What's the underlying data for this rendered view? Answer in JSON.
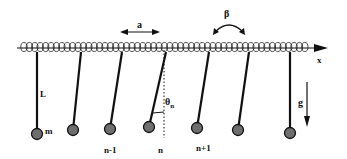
{
  "diagram": {
    "labels": {
      "spacing": "a",
      "torsion": "β",
      "axis": "x",
      "length": "L",
      "mass": "m",
      "angle": "θ",
      "angle_sub": "n",
      "gravity": "g",
      "index_prev": "n-1",
      "index_curr": "n",
      "index_next": "n+1"
    },
    "colors": {
      "line": "#111111",
      "bob_fill": "#6e6e6e",
      "background": "#ffffff"
    },
    "pendulums": [
      {
        "top_x": 37,
        "bob_x": 37,
        "bob_y": 134
      },
      {
        "top_x": 81,
        "bob_x": 73,
        "bob_y": 130
      },
      {
        "top_x": 122,
        "bob_x": 110,
        "bob_y": 129
      },
      {
        "top_x": 166,
        "bob_x": 149,
        "bob_y": 127
      },
      {
        "top_x": 209,
        "bob_x": 197,
        "bob_y": 128
      },
      {
        "top_x": 249,
        "bob_x": 238,
        "bob_y": 130
      },
      {
        "top_x": 290,
        "bob_x": 290,
        "bob_y": 133
      }
    ]
  }
}
